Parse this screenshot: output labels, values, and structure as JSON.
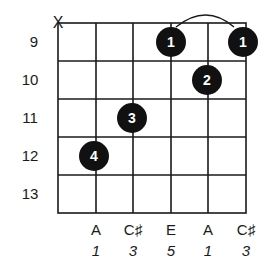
{
  "chord_diagram": {
    "muted_marker": "X",
    "frets": [
      "9",
      "10",
      "11",
      "12",
      "13"
    ],
    "strings": 6,
    "dots": [
      {
        "string": 3,
        "fret_row": 0,
        "finger": "1"
      },
      {
        "string": 5,
        "fret_row": 0,
        "finger": "1"
      },
      {
        "string": 4,
        "fret_row": 1,
        "finger": "2"
      },
      {
        "string": 2,
        "fret_row": 2,
        "finger": "3"
      },
      {
        "string": 1,
        "fret_row": 3,
        "finger": "4"
      }
    ],
    "barre": {
      "from_string": 3,
      "to_string": 5,
      "fret_row": 0
    },
    "notes": [
      "A",
      "C♯",
      "E",
      "A",
      "C♯"
    ],
    "intervals": [
      "1",
      "3",
      "5",
      "1",
      "3"
    ],
    "colors": {
      "line": "#1a1a1a",
      "dot": "#111111",
      "dot_text": "#ffffff"
    }
  }
}
